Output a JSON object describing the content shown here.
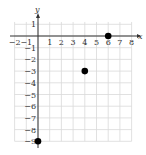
{
  "chart_data": {
    "type": "scatter",
    "title": "",
    "xlabel": "x",
    "ylabel": "y",
    "xlim": [
      -2,
      8
    ],
    "ylim": [
      -9,
      1
    ],
    "grid": true,
    "x_ticks": [
      "−2",
      "−1",
      "1",
      "2",
      "3",
      "4",
      "5",
      "6",
      "7",
      "8"
    ],
    "y_ticks": [
      "1",
      "−1",
      "−2",
      "−3",
      "−4",
      "−5",
      "−6",
      "−7",
      "−8",
      "−9"
    ],
    "points": [
      {
        "x": 6,
        "y": 0
      },
      {
        "x": 4,
        "y": -3
      },
      {
        "x": 0,
        "y": -9
      }
    ],
    "colors": {
      "grid": "#d9d9d9",
      "axis": "#333333",
      "point": "#000000"
    }
  }
}
